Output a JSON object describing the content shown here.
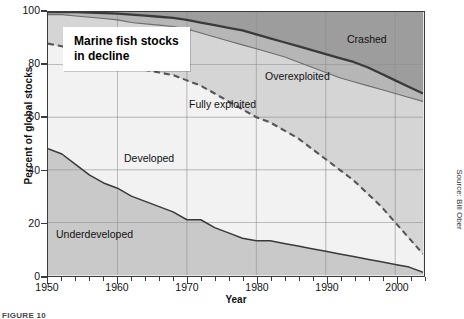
{
  "figure": {
    "callout_line1": "Marine fish stocks",
    "callout_line2": "in decline",
    "source": "Source: Bill Ober",
    "caption": "FIGURE 10"
  },
  "colors": {
    "underdeveloped": "#c9c9c9",
    "developed": "#f2f2f2",
    "fully_exploited": "#d5d5d5",
    "overexploited": "#b6b6b6",
    "crashed": "#9d9d9d",
    "axis": "#3b3b3b",
    "grid": "#8e8e8e",
    "solid_line": "#3a3a3a",
    "dashed_line": "#555555"
  },
  "chart_data": {
    "type": "area",
    "title": "Marine fish stocks in decline",
    "xlabel": "Year",
    "ylabel": "Percent of global stocks",
    "xlim": [
      1950,
      2004
    ],
    "ylim": [
      0,
      100
    ],
    "grid": true,
    "legend": "inline band labels",
    "xticks": [
      1950,
      1960,
      1970,
      1980,
      1990,
      2000
    ],
    "yticks": [
      0,
      20,
      40,
      60,
      80,
      100
    ],
    "minor_tick_interval_years": 2,
    "stacking": "cumulative from bottom to 100%",
    "x": [
      1950,
      1952,
      1954,
      1956,
      1958,
      1960,
      1962,
      1964,
      1966,
      1968,
      1970,
      1972,
      1974,
      1976,
      1978,
      1980,
      1982,
      1984,
      1986,
      1988,
      1990,
      1992,
      1994,
      1996,
      1998,
      2000,
      2002,
      2004
    ],
    "series": [
      {
        "name": "Underdeveloped",
        "note": "bottom band; value = upper boundary of band (cumulative %)",
        "values": [
          48,
          46,
          42,
          38,
          35,
          33,
          30,
          28,
          26,
          24,
          21,
          21,
          18,
          16,
          14,
          13,
          13,
          12,
          11,
          10,
          9,
          8,
          7,
          6,
          5,
          4,
          3,
          1
        ]
      },
      {
        "name": "Developed",
        "note": "second band; value = cumulative upper boundary (dashed line)",
        "values": [
          88,
          87,
          85,
          84,
          82,
          80,
          79,
          78,
          77,
          76,
          74,
          72,
          69,
          66,
          63,
          60,
          58,
          55,
          52,
          48,
          44,
          40,
          36,
          31,
          26,
          20,
          14,
          8
        ]
      },
      {
        "name": "Fully exploited",
        "note": "third band; value = cumulative upper boundary",
        "values": [
          99,
          99,
          98.5,
          98,
          97.5,
          97,
          96,
          95.5,
          95,
          94.5,
          93.5,
          92,
          90.5,
          89,
          87.5,
          86,
          84.5,
          83,
          81,
          79,
          77,
          75,
          73.5,
          72,
          70.5,
          69,
          67.5,
          66
        ]
      },
      {
        "name": "Overexploited",
        "note": "fourth band; value = cumulative upper boundary (bold solid line)",
        "values": [
          100,
          100,
          100,
          99.8,
          99.6,
          99.4,
          99,
          98.6,
          98.2,
          97.8,
          97,
          96,
          95,
          94,
          93,
          91.5,
          90,
          88.5,
          87,
          85.5,
          84,
          82.5,
          81,
          79,
          76.5,
          74,
          71.5,
          69
        ]
      },
      {
        "name": "Crashed",
        "note": "top band; remainder up to 100%",
        "values": [
          0,
          0,
          0,
          0.2,
          0.4,
          0.6,
          1,
          1.4,
          1.8,
          2.2,
          3,
          4,
          5,
          6,
          7,
          8.5,
          10,
          11.5,
          13,
          14.5,
          16,
          17.5,
          19,
          21,
          23.5,
          26,
          28.5,
          31
        ]
      }
    ],
    "band_labels": [
      {
        "text": "Underdeveloped",
        "x_px": 56,
        "y_px": 228
      },
      {
        "text": "Developed",
        "x_px": 124,
        "y_px": 152
      },
      {
        "text": "Fully exploited",
        "x_px": 189,
        "y_px": 98
      },
      {
        "text": "Overexploited",
        "x_px": 265,
        "y_px": 70
      },
      {
        "text": "Crashed",
        "x_px": 347,
        "y_px": 33
      }
    ]
  }
}
